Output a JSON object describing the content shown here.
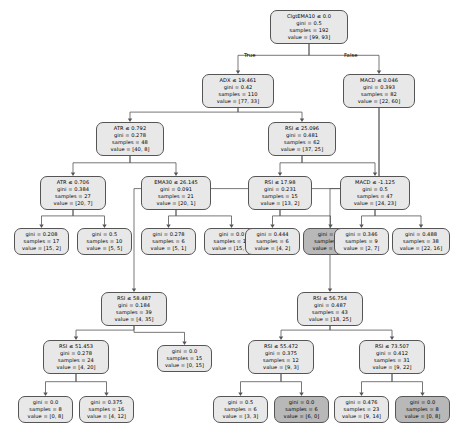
{
  "figure": {
    "type": "decision-tree",
    "caption": "Decision tree model for trading signal",
    "branch_labels": {
      "left": "True",
      "right": "False"
    }
  },
  "chart_data": {
    "type": "tree",
    "node_fields": [
      "condition",
      "gini",
      "samples",
      "value"
    ],
    "nodes": [
      {
        "id": "n0",
        "condition": "ClgtEMA10 ≤ 0.0",
        "gini": "gini = 0.5",
        "samples": "samples = 192",
        "value": "value = [99, 93]",
        "fill": "#e8e8e8",
        "x": 270,
        "y": 10,
        "w": 78,
        "h": 30
      },
      {
        "id": "n1",
        "condition": "ADX ≤ 19.461",
        "gini": "gini = 0.42",
        "samples": "samples = 110",
        "value": "value = [77, 33]",
        "fill": "#e8e8e8",
        "x": 202,
        "y": 74,
        "w": 72,
        "h": 30
      },
      {
        "id": "n2",
        "condition": "MACD ≤ 0.046",
        "gini": "gini = 0.393",
        "samples": "samples = 82",
        "value": "value = [22, 60]",
        "fill": "#e8e8e8",
        "x": 343,
        "y": 74,
        "w": 72,
        "h": 30
      },
      {
        "id": "n3",
        "condition": "ATR ≤ 0.792",
        "gini": "gini = 0.278",
        "samples": "samples = 48",
        "value": "value = [40, 8]",
        "fill": "#e8e8e8",
        "x": 96,
        "y": 122,
        "w": 68,
        "h": 30
      },
      {
        "id": "n4",
        "condition": "RSI ≤ 25.096",
        "gini": "gini = 0.481",
        "samples": "samples = 62",
        "value": "value = [37, 25]",
        "fill": "#e8e8e8",
        "x": 268,
        "y": 122,
        "w": 68,
        "h": 30
      },
      {
        "id": "n5",
        "condition": "ATR ≤ 0.706",
        "gini": "gini = 0.384",
        "samples": "samples = 27",
        "value": "value = [20, 7]",
        "fill": "#e8e8e8",
        "x": 40,
        "y": 176,
        "w": 66,
        "h": 30
      },
      {
        "id": "n6",
        "condition": "EMA30 ≤ 26.145",
        "gini": "gini = 0.091",
        "samples": "samples = 21",
        "value": "value = [20, 1]",
        "fill": "#e8e8e8",
        "x": 141,
        "y": 176,
        "w": 70,
        "h": 30
      },
      {
        "id": "n7",
        "condition": "RSI ≤ 17.98",
        "gini": "gini = 0.231",
        "samples": "samples = 15",
        "value": "value = [13, 2]",
        "fill": "#e8e8e8",
        "x": 248,
        "y": 176,
        "w": 64,
        "h": 30
      },
      {
        "id": "n8",
        "condition": "MACD ≤ -1.125",
        "gini": "gini = 0.5",
        "samples": "samples = 47",
        "value": "value = [24, 23]",
        "fill": "#e8e8e8",
        "x": 340,
        "y": 176,
        "w": 70,
        "h": 30
      },
      {
        "id": "n9",
        "condition": "",
        "gini": "gini = 0.208",
        "samples": "samples = 17",
        "value": "value = [15, 2]",
        "fill": "#e8e8e8",
        "x": 14,
        "y": 228,
        "w": 55,
        "h": 25
      },
      {
        "id": "n10",
        "condition": "",
        "gini": "gini = 0.5",
        "samples": "samples = 10",
        "value": "value = [5, 5]",
        "fill": "#e8e8e8",
        "x": 77,
        "y": 228,
        "w": 55,
        "h": 25
      },
      {
        "id": "n11",
        "condition": "",
        "gini": "gini = 0.278",
        "samples": "samples = 6",
        "value": "value = [5, 1]",
        "fill": "#e8e8e8",
        "x": 141,
        "y": 228,
        "w": 55,
        "h": 25
      },
      {
        "id": "n12",
        "condition": "",
        "gini": "gini = 0.0",
        "samples": "samples = 15",
        "value": "value = [15, 0]",
        "fill": "#e8e8e8",
        "x": 204,
        "y": 228,
        "w": 55,
        "h": 25
      },
      {
        "id": "n13",
        "condition": "",
        "gini": "gini = 0.444",
        "samples": "samples = 6",
        "value": "value = [4, 2]",
        "fill": "#e8e8e8",
        "x": 245,
        "y": 228,
        "w": 55,
        "h": 25
      },
      {
        "id": "n14",
        "condition": "",
        "gini": "gini = 0.0",
        "samples": "samples = 9",
        "value": "value = [9, 0]",
        "fill": "#b8b8b8",
        "x": 303,
        "y": 228,
        "w": 55,
        "h": 25
      },
      {
        "id": "n15",
        "condition": "",
        "gini": "gini = 0.346",
        "samples": "samples = 9",
        "value": "value = [2, 7]",
        "fill": "#e8e8e8",
        "x": 334,
        "y": 228,
        "w": 55,
        "h": 25
      },
      {
        "id": "n16",
        "condition": "",
        "gini": "gini = 0.488",
        "samples": "samples = 38",
        "value": "value = [22, 16]",
        "fill": "#e8e8e8",
        "x": 392,
        "y": 228,
        "w": 58,
        "h": 25
      },
      {
        "id": "n17",
        "condition": "RSI ≤ 58.487",
        "gini": "gini = 0.184",
        "samples": "samples = 39",
        "value": "value = [4, 35]",
        "fill": "#e8e8e8",
        "x": 101,
        "y": 292,
        "w": 66,
        "h": 30
      },
      {
        "id": "n18",
        "condition": "RSI ≤ 56.754",
        "gini": "gini = 0.487",
        "samples": "samples = 43",
        "value": "value = [18, 25]",
        "fill": "#e8e8e8",
        "x": 297,
        "y": 292,
        "w": 66,
        "h": 30
      },
      {
        "id": "n19",
        "condition": "RSI ≤ 51.453",
        "gini": "gini = 0.278",
        "samples": "samples = 24",
        "value": "value = [4, 20]",
        "fill": "#e8e8e8",
        "x": 43,
        "y": 340,
        "w": 66,
        "h": 30
      },
      {
        "id": "n20",
        "condition": "",
        "gini": "gini = 0.0",
        "samples": "samples = 15",
        "value": "value = [0, 15]",
        "fill": "#e8e8e8",
        "x": 157,
        "y": 345,
        "w": 55,
        "h": 25
      },
      {
        "id": "n21",
        "condition": "RSI ≤ 55.472",
        "gini": "gini = 0.375",
        "samples": "samples = 12",
        "value": "value = [9, 3]",
        "fill": "#e8e8e8",
        "x": 248,
        "y": 340,
        "w": 66,
        "h": 30
      },
      {
        "id": "n22",
        "condition": "RSI ≤ 73.507",
        "gini": "gini = 0.412",
        "samples": "samples = 31",
        "value": "value = [9, 22]",
        "fill": "#e8e8e8",
        "x": 359,
        "y": 340,
        "w": 66,
        "h": 30
      },
      {
        "id": "n23",
        "condition": "",
        "gini": "gini = 0.0",
        "samples": "samples = 8",
        "value": "value = [0, 8]",
        "fill": "#e8e8e8",
        "x": 18,
        "y": 396,
        "w": 55,
        "h": 25
      },
      {
        "id": "n24",
        "condition": "",
        "gini": "gini = 0.375",
        "samples": "samples = 16",
        "value": "value = [4, 12]",
        "fill": "#e8e8e8",
        "x": 79,
        "y": 396,
        "w": 55,
        "h": 25
      },
      {
        "id": "n25",
        "condition": "",
        "gini": "gini = 0.5",
        "samples": "samples = 6",
        "value": "value = [3, 3]",
        "fill": "#e8e8e8",
        "x": 213,
        "y": 396,
        "w": 55,
        "h": 25
      },
      {
        "id": "n26",
        "condition": "",
        "gini": "gini = 0.0",
        "samples": "samples = 6",
        "value": "value = [6, 0]",
        "fill": "#b8b8b8",
        "x": 274,
        "y": 396,
        "w": 55,
        "h": 25
      },
      {
        "id": "n27",
        "condition": "",
        "gini": "gini = 0.476",
        "samples": "samples = 23",
        "value": "value = [9, 14]",
        "fill": "#e8e8e8",
        "x": 334,
        "y": 396,
        "w": 55,
        "h": 25
      },
      {
        "id": "n28",
        "condition": "",
        "gini": "gini = 0.0",
        "samples": "samples = 8",
        "value": "value = [0, 8]",
        "fill": "#b8b8b8",
        "x": 395,
        "y": 396,
        "w": 55,
        "h": 25
      }
    ],
    "edges": [
      {
        "from": "n0",
        "to": "n1"
      },
      {
        "from": "n0",
        "to": "n2"
      },
      {
        "from": "n1",
        "to": "n3"
      },
      {
        "from": "n1",
        "to": "n4"
      },
      {
        "from": "n3",
        "to": "n5"
      },
      {
        "from": "n3",
        "to": "n6"
      },
      {
        "from": "n4",
        "to": "n7"
      },
      {
        "from": "n4",
        "to": "n8"
      },
      {
        "from": "n5",
        "to": "n9"
      },
      {
        "from": "n5",
        "to": "n10"
      },
      {
        "from": "n6",
        "to": "n11"
      },
      {
        "from": "n6",
        "to": "n12"
      },
      {
        "from": "n7",
        "to": "n13"
      },
      {
        "from": "n7",
        "to": "n14"
      },
      {
        "from": "n8",
        "to": "n15"
      },
      {
        "from": "n8",
        "to": "n16"
      },
      {
        "from": "n2",
        "to": "n17"
      },
      {
        "from": "n2",
        "to": "n18"
      },
      {
        "from": "n17",
        "to": "n19"
      },
      {
        "from": "n17",
        "to": "n20"
      },
      {
        "from": "n18",
        "to": "n21"
      },
      {
        "from": "n18",
        "to": "n22"
      },
      {
        "from": "n19",
        "to": "n23"
      },
      {
        "from": "n19",
        "to": "n24"
      },
      {
        "from": "n21",
        "to": "n25"
      },
      {
        "from": "n21",
        "to": "n26"
      },
      {
        "from": "n22",
        "to": "n27"
      },
      {
        "from": "n22",
        "to": "n28"
      }
    ]
  }
}
